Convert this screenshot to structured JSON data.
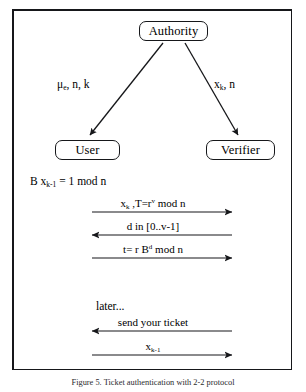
{
  "figure": {
    "caption": "Figure 5. Ticket authentication with 2-2 protocol",
    "frame_color": "#16171a",
    "background": "#ffffff"
  },
  "nodes": [
    {
      "id": "authority",
      "label": "Authority"
    },
    {
      "id": "user",
      "label": "User"
    },
    {
      "id": "verifier",
      "label": "Verifier"
    }
  ],
  "branch_labels": {
    "left": {
      "base": "μ",
      "sub": "e",
      "rest": ", n, k"
    },
    "right": {
      "base": "x",
      "sub": "k",
      "rest": ", n"
    }
  },
  "equations": {
    "user_relation": {
      "prefix": "B x",
      "sub": "k-1",
      "rest": " = 1 mod n"
    },
    "later_note": "later..."
  },
  "messages": [
    {
      "id": "m1",
      "direction": "right",
      "parts": [
        {
          "t": "x"
        },
        {
          "sub": "k"
        },
        {
          "t": " ,T=r"
        },
        {
          "sup": "v"
        },
        {
          "t": " mod n"
        }
      ]
    },
    {
      "id": "m2",
      "direction": "left",
      "parts": [
        {
          "t": "d in [0..v-1]"
        }
      ]
    },
    {
      "id": "m3",
      "direction": "right",
      "parts": [
        {
          "t": "t= r B"
        },
        {
          "sup": "d"
        },
        {
          "t": " mod n"
        }
      ]
    },
    {
      "id": "m4",
      "direction": "left",
      "parts": [
        {
          "t": "send your ticket"
        }
      ]
    },
    {
      "id": "m5",
      "direction": "right",
      "parts": [
        {
          "t": "x"
        },
        {
          "sub": "k-1"
        }
      ]
    }
  ],
  "plain_text": {
    "branch_left": "μe, n, k",
    "branch_right": "xk, n",
    "user_relation": "B xk-1 = 1 mod n",
    "msg_1": "xk ,T=rv mod n",
    "msg_2": "d in [0..v-1]",
    "msg_3": "t= r Bd mod n",
    "msg_4": "send your ticket",
    "msg_5": "xk-1"
  }
}
